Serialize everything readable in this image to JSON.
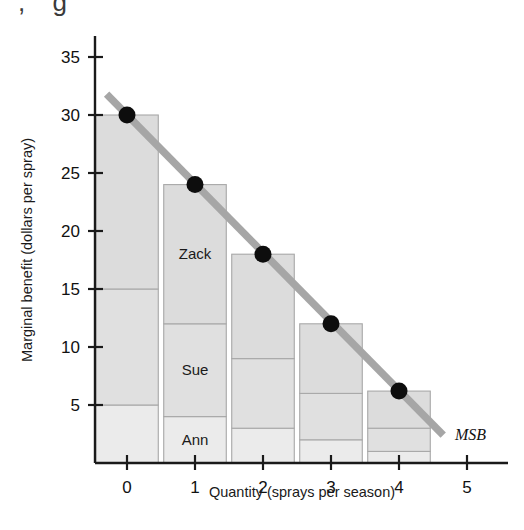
{
  "chart_data": {
    "type": "bar",
    "title": "",
    "xlabel": "Quantity (sprays per season)",
    "ylabel": "Marginal benefit (dollars per spray)",
    "xlim": [
      -0.35,
      5.6
    ],
    "ylim": [
      0,
      37
    ],
    "xticks": [
      0,
      1,
      2,
      3,
      4,
      5
    ],
    "xticklabels": [
      "0",
      "1",
      "2",
      "3",
      "4",
      "5"
    ],
    "yticks": [
      5,
      10,
      15,
      20,
      25,
      30,
      35
    ],
    "yticklabels": [
      "5",
      "10",
      "15",
      "20",
      "25",
      "30",
      "35"
    ],
    "grid": false,
    "legend": "none",
    "stacked": true,
    "categories": [
      "0",
      "1",
      "2",
      "3",
      "4"
    ],
    "series": [
      {
        "name": "Ann",
        "label": "Ann",
        "color": "#ebebeb",
        "values": [
          5,
          4,
          3,
          2,
          1
        ]
      },
      {
        "name": "Sue",
        "label": "Sue",
        "color": "#e0e0e0",
        "values": [
          10,
          8,
          6,
          4,
          2
        ]
      },
      {
        "name": "Zack",
        "label": "Zack",
        "color": "#dcdcdc",
        "values": [
          15,
          12,
          9,
          6,
          3.2
        ]
      }
    ],
    "totals": [
      30,
      24,
      18,
      12,
      6.2
    ],
    "overlay_line": {
      "name": "MSB",
      "label": "MSB",
      "color": "#a6a6a6",
      "points": [
        {
          "x": 0,
          "y": 30
        },
        {
          "x": 1,
          "y": 24
        },
        {
          "x": 2,
          "y": 18
        },
        {
          "x": 3,
          "y": 12
        },
        {
          "x": 4,
          "y": 6.2
        }
      ],
      "extends_from": {
        "x": -0.3,
        "y": 31.8
      },
      "extends_to": {
        "x": 4.65,
        "y": 2.4
      },
      "marker": "filled-circle",
      "marker_color": "#0d0d0d"
    },
    "segment_labels": [
      {
        "text": "Zack",
        "series": "Zack",
        "bar": "1"
      },
      {
        "text": "Sue",
        "series": "Sue",
        "bar": "1"
      },
      {
        "text": "Ann",
        "series": "Ann",
        "bar": "1"
      }
    ],
    "colors": {
      "axis": "#1a1a1a",
      "bar_edge": "#a8a8a8",
      "msb_line": "#a6a6a6",
      "marker": "#0d0d0d",
      "ann_fill": "#ebebeb",
      "sue_fill": "#e0e0e0",
      "zack_fill": "#dcdcdc"
    }
  },
  "figure": {
    "top_fragment": ", g"
  }
}
